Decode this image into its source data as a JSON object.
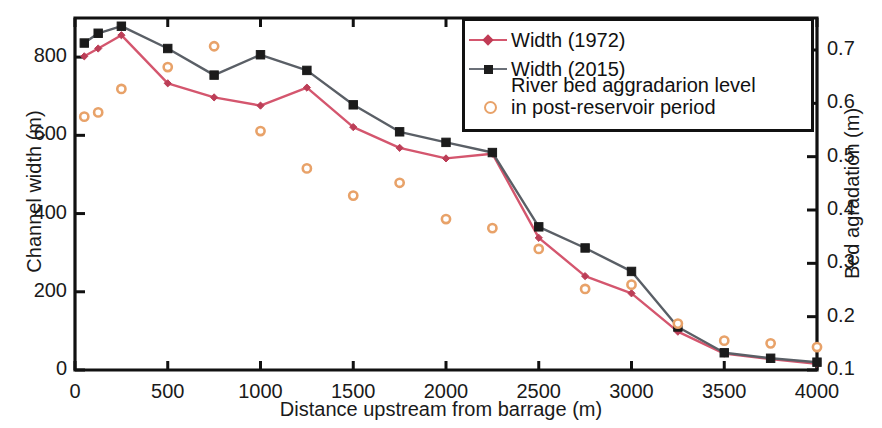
{
  "chart_data": {
    "type": "line",
    "title": "",
    "xlabel": "Distance upstream from barrage (m)",
    "ylabel": "Channel width (m)",
    "y2label": "Bed agradation (m)",
    "xlim": [
      0,
      4000
    ],
    "ylim": [
      0,
      900
    ],
    "y2lim": [
      0.1,
      0.76
    ],
    "xticks": [
      0,
      500,
      1000,
      1500,
      2000,
      2500,
      3000,
      3500,
      4000
    ],
    "xticklabels": [
      "0",
      "500",
      "1000",
      "1500",
      "2000",
      "2500",
      "3000",
      "3500",
      "4000"
    ],
    "yticks": [
      0,
      200,
      400,
      600,
      800
    ],
    "yticklabels": [
      "0",
      "200",
      "400",
      "600",
      "800"
    ],
    "y2ticks": [
      0.1,
      0.2,
      0.3,
      0.4,
      0.5,
      0.6,
      0.7
    ],
    "y2ticklabels": [
      "0.1",
      "0.2",
      "0.3",
      "0.4",
      "0.5",
      "0.6",
      "0.7"
    ],
    "grid": false,
    "legend_position": "top-right",
    "series": [
      {
        "name": "Width (1972)",
        "axis": "left",
        "color": "#d4566e",
        "marker": "diamond",
        "x": [
          50,
          125,
          250,
          500,
          750,
          1000,
          1250,
          1500,
          1750,
          2000,
          2250,
          2500,
          2750,
          3000,
          3250,
          3500,
          3750,
          4000
        ],
        "y": [
          802,
          822,
          856,
          733,
          697,
          676,
          722,
          621,
          568,
          541,
          553,
          338,
          240,
          196,
          98,
          42,
          28,
          16
        ]
      },
      {
        "name": "Width (2015)",
        "axis": "left",
        "color": "#5a5f66",
        "marker": "square",
        "x": [
          50,
          125,
          250,
          500,
          750,
          1000,
          1250,
          1500,
          1750,
          2000,
          2250,
          2500,
          2750,
          3000,
          3250,
          3500,
          3750,
          4000
        ],
        "y": [
          836,
          861,
          879,
          822,
          754,
          806,
          766,
          678,
          609,
          582,
          556,
          366,
          312,
          252,
          110,
          44,
          30,
          20
        ]
      },
      {
        "name": "River bed aggradarion level in post-reservoir period",
        "axis": "right",
        "color": "#e8a269",
        "marker": "open-circle",
        "x": [
          50,
          125,
          250,
          500,
          750,
          1000,
          1250,
          1500,
          1750,
          2000,
          2250,
          2500,
          2750,
          3000,
          3250,
          3500,
          3750,
          4000
        ],
        "y": [
          0.575,
          0.583,
          0.627,
          0.668,
          0.707,
          0.548,
          0.478,
          0.427,
          0.451,
          0.383,
          0.366,
          0.327,
          0.252,
          0.26,
          0.187,
          0.155,
          0.15,
          0.143
        ]
      }
    ]
  },
  "legend": {
    "items": [
      {
        "label": "Width (1972)",
        "marker": "diamond-line",
        "color": "#d4566e"
      },
      {
        "label": "Width (2015)",
        "marker": "square-line",
        "color": "#5a5f66"
      },
      {
        "label": "River bed aggradarion level",
        "label2": "in post-reservoir period",
        "marker": "open-circle",
        "color": "#e8a269"
      }
    ]
  }
}
